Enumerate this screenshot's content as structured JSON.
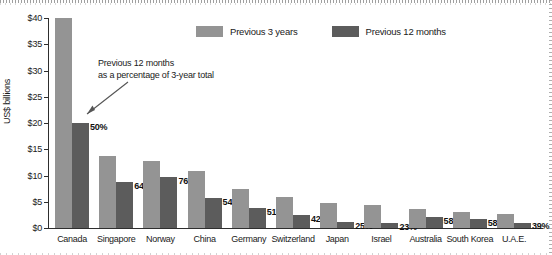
{
  "chart_data": {
    "type": "bar",
    "title": "",
    "xlabel": "",
    "ylabel": "US$ billions",
    "ylim": [
      0,
      40
    ],
    "grid": false,
    "legend_position": "top-center",
    "categories": [
      "Canada",
      "Singapore",
      "Norway",
      "China",
      "Germany",
      "Switzerland",
      "Japan",
      "Israel",
      "Australia",
      "South Korea",
      "U.A.E."
    ],
    "series": [
      {
        "name": "Previous 3 years",
        "color": "#949494",
        "values": [
          40.0,
          13.8,
          12.8,
          10.8,
          7.4,
          6.0,
          4.7,
          4.3,
          3.6,
          3.1,
          2.7
        ]
      },
      {
        "name": "Previous 12 months",
        "color": "#5c5c5c",
        "values": [
          20.0,
          8.8,
          9.7,
          5.8,
          3.8,
          2.5,
          1.2,
          1.0,
          2.1,
          1.8,
          1.05
        ]
      }
    ],
    "point_labels": [
      "50%",
      "64%",
      "76%",
      "54%",
      "51%",
      "42%",
      "25%",
      "23%",
      "58%",
      "58%",
      "39%"
    ],
    "ytick_labels": [
      "$0",
      "$5",
      "$10",
      "$15",
      "$20",
      "$25",
      "$30",
      "$35",
      "$40"
    ],
    "ytick_values": [
      0,
      5,
      10,
      15,
      20,
      25,
      30,
      35,
      40
    ],
    "annotations": [
      {
        "text_line_1": "Previous 12 months",
        "text_line_2": "as a percentage of 3-year total",
        "target": "Canada"
      }
    ]
  },
  "axis": {
    "y_title": "US$ billions"
  },
  "legend": {
    "items": [
      {
        "label": "Previous 3 years",
        "color": "#949494"
      },
      {
        "label": "Previous 12 months",
        "color": "#5c5c5c"
      }
    ]
  },
  "annotation": {
    "line1": "Previous 12 months",
    "line2": "as a percentage of 3-year total"
  }
}
